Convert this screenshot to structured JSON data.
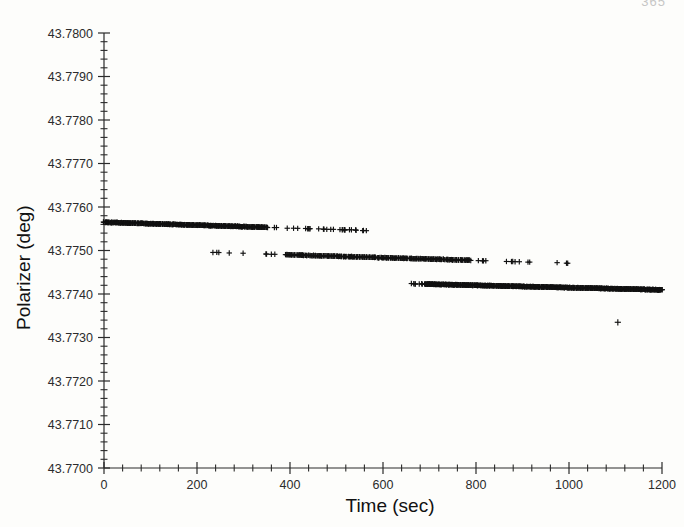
{
  "page": {
    "page_number": "365",
    "background_color": "#fdfdfb",
    "ink_color": "#1a1a1a"
  },
  "chart_data": {
    "type": "scatter",
    "title": "",
    "xlabel": "Time (sec)",
    "ylabel": "Polarizer (deg)",
    "xlim": [
      0,
      1200
    ],
    "ylim": [
      43.77,
      43.78
    ],
    "grid": false,
    "legend": null,
    "marker": "plus",
    "marker_color": "#111111",
    "xticks": [
      0,
      200,
      400,
      600,
      800,
      1000,
      1200
    ],
    "xtick_labels": [
      "0",
      "200",
      "400",
      "600",
      "800",
      "1000",
      "1200"
    ],
    "x_minor_tick_step": 40,
    "yticks": [
      43.77,
      43.771,
      43.772,
      43.773,
      43.774,
      43.775,
      43.776,
      43.777,
      43.778,
      43.779,
      43.78
    ],
    "ytick_labels": [
      "43.7700",
      "43.7710",
      "43.7720",
      "43.7730",
      "43.7740",
      "43.7750",
      "43.7760",
      "43.7770",
      "43.7780",
      "43.7790",
      "43.7800"
    ],
    "y_minor_ticks_per_major": 5,
    "series": [
      {
        "name": "branch-1-upper",
        "description": "Dense upper band drifting from 43.77565 near t=0 to 43.77545 near t=580, with sparse trailing points",
        "x_start": 0,
        "x_end": 580,
        "y_start": 43.77565,
        "y_end": 43.775455,
        "dense_until": 350,
        "n_points": 620
      },
      {
        "name": "branch-2-middle",
        "description": "Middle band from t=228 at 43.77495 drifting to 43.77470 near t=1010, sparse at both ends",
        "x_start": 228,
        "x_end": 1010,
        "y_start": 43.774955,
        "y_end": 43.774705,
        "dense_from": 390,
        "dense_until": 790,
        "n_points": 520
      },
      {
        "name": "branch-3-lower",
        "description": "Lower band from t=590 at 43.77425 drifting to 43.774095 at t=1200, dense from t=690 onward",
        "x_start": 590,
        "x_end": 1200,
        "y_start": 43.774255,
        "y_end": 43.774095,
        "dense_from": 690,
        "n_points": 760
      }
    ],
    "outliers": [
      {
        "x": 1105,
        "y": 43.77335,
        "label": "isolated low point"
      }
    ]
  }
}
